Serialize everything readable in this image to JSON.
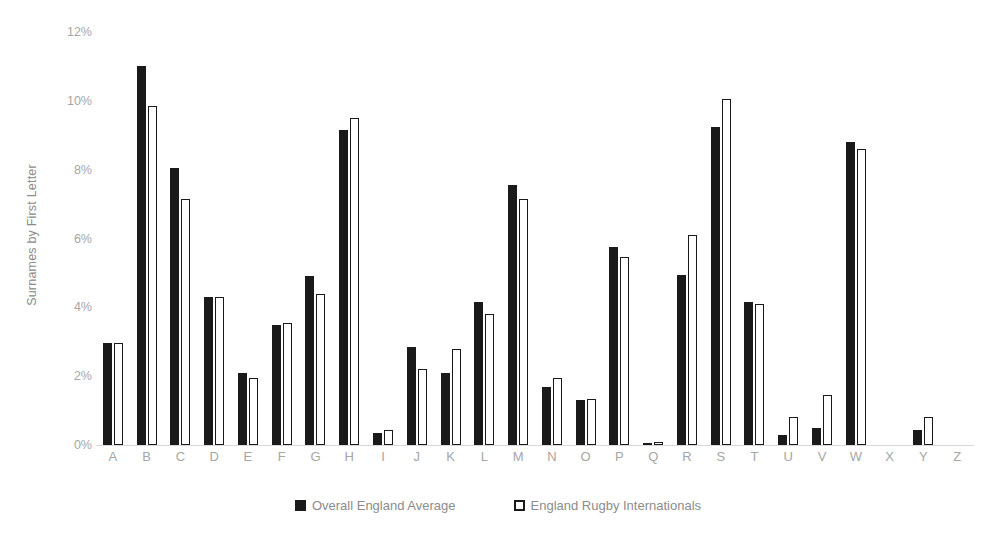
{
  "chart_data": {
    "type": "bar",
    "title": "",
    "xlabel": "",
    "ylabel": "Surnames by First Letter",
    "ylim": [
      0,
      12
    ],
    "ytick_values": [
      0,
      2,
      4,
      6,
      8,
      10,
      12
    ],
    "ytick_labels": [
      "0%",
      "2%",
      "4%",
      "6%",
      "8%",
      "10%",
      "12%"
    ],
    "grid": false,
    "legend_position": "bottom",
    "categories": [
      "A",
      "B",
      "C",
      "D",
      "E",
      "F",
      "G",
      "H",
      "I",
      "J",
      "K",
      "L",
      "M",
      "N",
      "O",
      "P",
      "Q",
      "R",
      "S",
      "T",
      "U",
      "V",
      "W",
      "X",
      "Y",
      "Z"
    ],
    "series": [
      {
        "name": "Overall England Average",
        "style": "filled",
        "color": "#1a1a1a",
        "values": [
          2.95,
          11.0,
          8.05,
          4.3,
          2.1,
          3.5,
          4.9,
          9.15,
          0.35,
          2.85,
          2.1,
          4.15,
          7.55,
          1.7,
          1.3,
          5.75,
          0.05,
          4.95,
          9.25,
          4.15,
          0.3,
          0.5,
          8.8,
          0.0,
          0.45,
          0.0
        ]
      },
      {
        "name": "England Rugby Internationals",
        "style": "outlined",
        "color": "#ffffff",
        "values": [
          2.95,
          9.85,
          7.15,
          4.3,
          1.95,
          3.55,
          4.4,
          9.5,
          0.45,
          2.2,
          2.8,
          3.8,
          7.15,
          1.95,
          1.35,
          5.45,
          0.1,
          6.1,
          10.05,
          4.1,
          0.8,
          1.45,
          8.6,
          0.0,
          0.8,
          0.0
        ]
      }
    ]
  },
  "legend": {
    "items": [
      {
        "label": "Overall England Average"
      },
      {
        "label": "England Rugby Internationals"
      }
    ]
  }
}
